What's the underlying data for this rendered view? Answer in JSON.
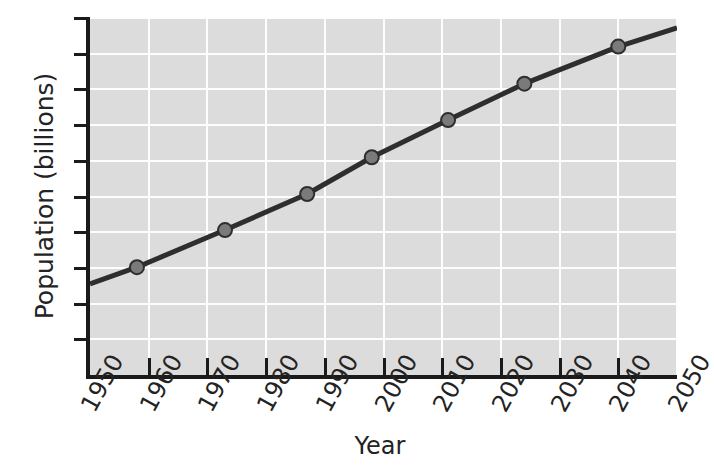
{
  "chart_data": {
    "type": "line",
    "title": "",
    "xlabel": "Year",
    "ylabel": "Population (billions)",
    "xlim": [
      1950,
      2050
    ],
    "ylim": [
      0,
      10
    ],
    "grid": true,
    "legend": "none",
    "x_tick_labels": [
      "1950",
      "1960",
      "1970",
      "1980",
      "1990",
      "2000",
      "2010",
      "2020",
      "2030",
      "2040",
      "2050"
    ],
    "x_ticks": [
      1950,
      1960,
      1970,
      1980,
      1990,
      2000,
      2010,
      2020,
      2030,
      2040,
      2050
    ],
    "y_tick_labels": [
      "0",
      "1",
      "2",
      "3",
      "4",
      "5",
      "6",
      "7",
      "8",
      "9",
      "10"
    ],
    "y_ticks": [
      0,
      1,
      2,
      3,
      4,
      5,
      6,
      7,
      8,
      9,
      10
    ],
    "series": [
      {
        "name": "World population",
        "line_color": "#2e2e2e",
        "marker_color": "#7a7a7a",
        "marker_edge_color": "#2e2e2e",
        "x": [
          1950,
          1958,
          1973,
          1987,
          1998,
          2011,
          2024,
          2040,
          2050
        ],
        "y": [
          2.55,
          3.02,
          4.06,
          5.07,
          6.1,
          7.14,
          8.16,
          9.2,
          9.72
        ],
        "marker_x": [
          1958,
          1973,
          1987,
          1998,
          2011,
          2024,
          2040
        ],
        "marker_y": [
          3.02,
          4.06,
          5.07,
          6.1,
          7.14,
          8.16,
          9.2
        ]
      }
    ]
  },
  "colors": {
    "plot_background": "#dcdcdc",
    "gridline": "#fdfdfd",
    "axis": "#1a1a1a",
    "text": "#232323",
    "page_background": "#ffffff"
  }
}
